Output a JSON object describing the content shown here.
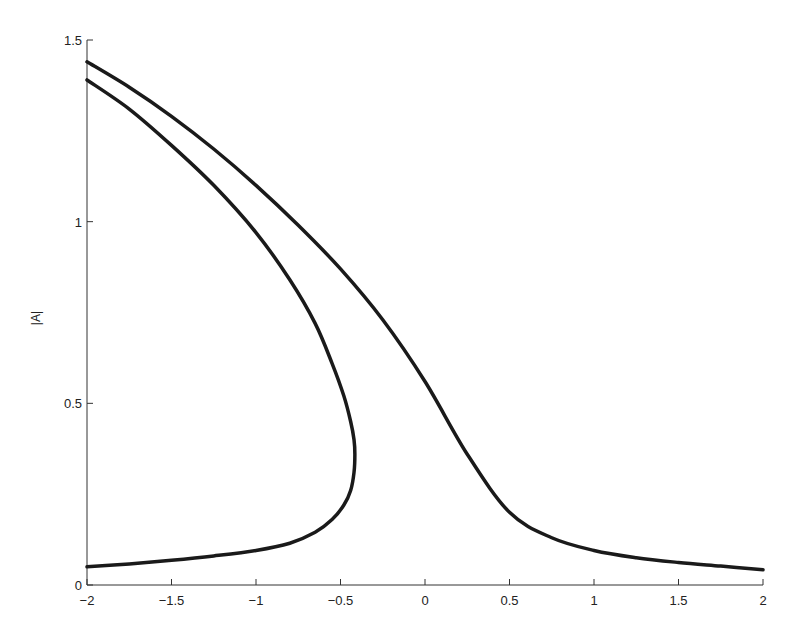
{
  "chart_data": {
    "type": "line",
    "title": "",
    "xlabel": "",
    "ylabel": "|A|",
    "xlim": [
      -2,
      2
    ],
    "ylim": [
      0,
      1.5
    ],
    "grid": false,
    "legend": null,
    "xticks": [
      -2,
      -1.5,
      -1,
      -0.5,
      0,
      0.5,
      1,
      1.5,
      2
    ],
    "xtick_labels": [
      "−2",
      "−1.5",
      "−1",
      "−0.5",
      "0",
      "0.5",
      "1",
      "1.5",
      "2"
    ],
    "yticks": [
      0,
      0.5,
      1,
      1.5
    ],
    "ytick_labels": [
      "0",
      "0.5",
      "1",
      "1.5"
    ],
    "series": [
      {
        "name": "outer-branch",
        "color": "#1a1a1a",
        "x": [
          -2.0,
          -1.75,
          -1.5,
          -1.25,
          -1.0,
          -0.75,
          -0.5,
          -0.25,
          0.0,
          0.25,
          0.5,
          0.75,
          1.0,
          1.25,
          1.5,
          1.75,
          2.0
        ],
        "y": [
          1.44,
          1.37,
          1.29,
          1.2,
          1.1,
          0.99,
          0.87,
          0.73,
          0.56,
          0.36,
          0.2,
          0.13,
          0.095,
          0.075,
          0.062,
          0.052,
          0.042
        ]
      },
      {
        "name": "folded-branch",
        "color": "#1a1a1a",
        "x": [
          -2.0,
          -1.75,
          -1.5,
          -1.25,
          -1.0,
          -0.8,
          -0.65,
          -0.55,
          -0.48,
          -0.44,
          -0.42,
          -0.415,
          -0.42,
          -0.44,
          -0.48,
          -0.55,
          -0.65,
          -0.8,
          -1.0,
          -1.25,
          -1.5,
          -1.75,
          -2.0
        ],
        "y": [
          1.39,
          1.31,
          1.21,
          1.1,
          0.97,
          0.84,
          0.72,
          0.61,
          0.52,
          0.45,
          0.4,
          0.36,
          0.31,
          0.26,
          0.22,
          0.18,
          0.145,
          0.115,
          0.095,
          0.08,
          0.068,
          0.058,
          0.05
        ]
      }
    ],
    "annotations": []
  }
}
